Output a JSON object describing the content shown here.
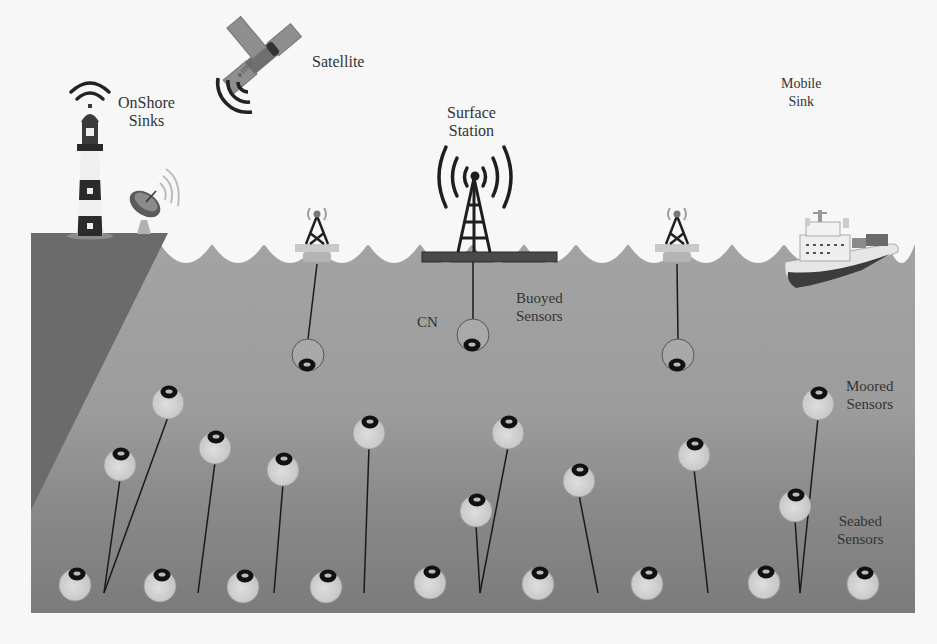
{
  "colors": {
    "background": "#f7f7f7",
    "water_top": "#a3a3a3",
    "water_bottom": "#7c7c7c",
    "shore": "#6b6b6b",
    "sensor_fill": "#d4d4d4",
    "sensor_ring": "#111111",
    "line": "#1a1a1a"
  },
  "labels": {
    "onshore_sinks": "OnShore\nSinks",
    "satellite": "Satellite",
    "surface_station": "Surface\nStation",
    "mobile_sink": "Mobile\nSink",
    "cn": "CN",
    "buoyed_sensors": "Buoyed\nSensors",
    "moored_sensors": "Moored\nSensors",
    "seabed_sensors": "Seabed\nSensors"
  },
  "nodes": {
    "onshore_sinks": [
      "lighthouse",
      "satellite-dish"
    ],
    "satellite": "satellite",
    "surface_station": "surface-station-tower",
    "mobile_sink": "research-ship",
    "surface_buoys": [
      {
        "x": 317,
        "y": 248
      },
      {
        "x": 677,
        "y": 248
      }
    ]
  },
  "sensors": {
    "buoyed": [
      {
        "x": 308,
        "y": 355,
        "tether_from": [
          317,
          264
        ]
      },
      {
        "x": 473,
        "y": 335,
        "tether_from": [
          473,
          262
        ]
      },
      {
        "x": 678,
        "y": 355,
        "tether_from": [
          677,
          264
        ]
      }
    ],
    "moored": [
      {
        "x": 168,
        "y": 403,
        "anchor": [
          104,
          593
        ]
      },
      {
        "x": 120,
        "y": 465,
        "anchor": [
          104,
          593
        ]
      },
      {
        "x": 215,
        "y": 448,
        "anchor": [
          198,
          593
        ]
      },
      {
        "x": 283,
        "y": 470,
        "anchor": [
          274,
          593
        ]
      },
      {
        "x": 369,
        "y": 433,
        "anchor": [
          364,
          593
        ]
      },
      {
        "x": 508,
        "y": 433,
        "anchor": [
          480,
          593
        ]
      },
      {
        "x": 476,
        "y": 511,
        "anchor": [
          480,
          593
        ]
      },
      {
        "x": 579,
        "y": 481,
        "anchor": [
          598,
          593
        ]
      },
      {
        "x": 694,
        "y": 455,
        "anchor": [
          708,
          593
        ]
      },
      {
        "x": 818,
        "y": 404,
        "anchor": [
          800,
          593
        ]
      },
      {
        "x": 795,
        "y": 506,
        "anchor": [
          800,
          593
        ]
      }
    ],
    "seabed": [
      {
        "x": 75,
        "y": 585
      },
      {
        "x": 160,
        "y": 586
      },
      {
        "x": 243,
        "y": 587
      },
      {
        "x": 326,
        "y": 587
      },
      {
        "x": 430,
        "y": 583
      },
      {
        "x": 538,
        "y": 584
      },
      {
        "x": 647,
        "y": 584
      },
      {
        "x": 764,
        "y": 583
      },
      {
        "x": 863,
        "y": 584
      }
    ]
  }
}
